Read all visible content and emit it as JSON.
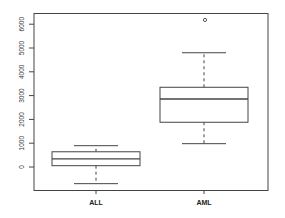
{
  "chart_data": {
    "type": "box",
    "title": "",
    "xlabel": "",
    "ylabel": "",
    "categories": [
      "ALL",
      "AML"
    ],
    "ylim": [
      -1000,
      6500
    ],
    "yticks": [
      0,
      1000,
      2000,
      3000,
      4000,
      5000,
      6000
    ],
    "ytick_labels": [
      "0",
      "1000",
      "2000",
      "3000",
      "4000",
      "5000",
      "6000"
    ],
    "grid": false,
    "boxes": [
      {
        "name": "ALL",
        "whisker_low": -700,
        "q1": 55,
        "median": 340,
        "q3": 640,
        "whisker_high": 895,
        "outliers": []
      },
      {
        "name": "AML",
        "whisker_low": 980,
        "q1": 1880,
        "median": 2860,
        "q3": 3350,
        "whisker_high": 4800,
        "outliers": [
          6180
        ]
      }
    ]
  },
  "style": {
    "line_color": "#444444",
    "background": "#ffffff"
  }
}
